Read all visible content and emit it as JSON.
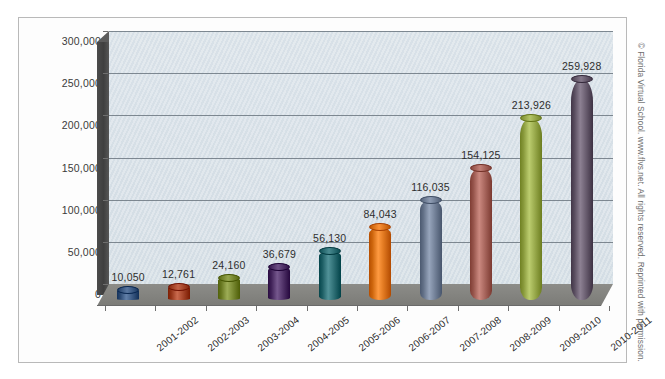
{
  "figure": {
    "copyright": "© Florida Virtual School. www.flvs.net. All rights reserved. Reprinted with permission."
  },
  "chart_data": {
    "type": "bar",
    "title": "",
    "xlabel": "",
    "ylabel": "",
    "ylim": [
      0,
      300000
    ],
    "grid": true,
    "legend": "none",
    "style": "3d-cylinder",
    "categories": [
      "2001-2002",
      "2002-2003",
      "2003-2004",
      "2004-2005",
      "2005-2006",
      "2006-2007",
      "2007-2008",
      "2008-2009",
      "2009-2010",
      "2010-2011"
    ],
    "values": [
      10050,
      12761,
      24160,
      36679,
      56130,
      84043,
      116035,
      154125,
      213926,
      259928
    ],
    "value_labels": [
      "10,050",
      "12,761",
      "24,160",
      "36,679",
      "56,130",
      "84,043",
      "116,035",
      "154,125",
      "213,926",
      "259,928"
    ],
    "ytick_values": [
      0,
      50000,
      100000,
      150000,
      200000,
      250000,
      300000
    ],
    "ytick_labels": [
      "0",
      "50,000",
      "100,000",
      "150,000",
      "200,000",
      "250,000",
      "300,000"
    ],
    "bar_colors": [
      "#3f5d86",
      "#a8482c",
      "#7b8b34",
      "#53356b",
      "#2f7076",
      "#e0781f",
      "#75839a",
      "#a9675e",
      "#9aab4d",
      "#6b5f71"
    ],
    "colors": {
      "plot_background": "#d8e1e8",
      "side_wall": "#4c4c4c",
      "floor": "#8c8c88",
      "gridline": "#6c7780",
      "text": "#2e2e2e",
      "frame_border": "#b9b9b9",
      "page_background": "#ffffff"
    }
  }
}
